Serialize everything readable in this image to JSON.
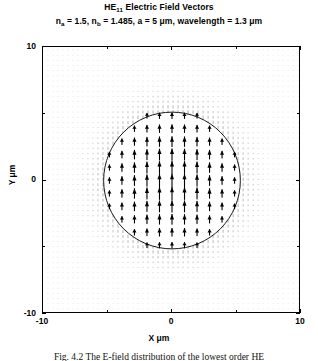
{
  "figure": {
    "title_main": "HE",
    "title_sub": "11",
    "title_rest": " Electric Field Vectors",
    "subtitle_parts": {
      "na_sym": "n",
      "na_sub": "a",
      "na_val": " = 1.5,  ",
      "nb_sym": "n",
      "nb_sub": "b",
      "nb_val": " = 1.485,   a  = 5 μm,   wavelength  =  1.3 μm"
    },
    "caption": "Fig. 4.2  The E-field distribution of the lowest order HE",
    "xtitle": "X μm",
    "ytitle": "Y μm",
    "ink_color": "#000000",
    "background_color": "#ffffff",
    "quiver_color": "#000000",
    "circle_color": "#1a1a1a"
  },
  "chart_data": {
    "type": "scatter",
    "subtype": "quiver-vector-field",
    "title": "HE11 Electric Field Vectors",
    "subtitle": "n_a = 1.5, n_b = 1.485, a = 5 μm, wavelength = 1.3 μm",
    "xlabel": "X μm",
    "ylabel": "Y μm",
    "xlim": [
      -10,
      10
    ],
    "ylim": [
      -10,
      10
    ],
    "grid": false,
    "xticks": [
      -10,
      0,
      10
    ],
    "yticks": [
      -10,
      0,
      10
    ],
    "xtick_labels": [
      "-10",
      "0",
      "10"
    ],
    "ytick_labels": [
      "-10",
      "0",
      "10"
    ],
    "xminor_ticks": [
      -5,
      5
    ],
    "yminor_ticks": [
      -5,
      5
    ],
    "legend": null,
    "annotations": [
      {
        "type": "circle",
        "label": "core-cladding boundary",
        "center_x": 0,
        "center_y": 0,
        "radius": 5.3
      }
    ],
    "parameters": {
      "n_a": 1.5,
      "n_b": 1.485,
      "core_radius_um": 5,
      "wavelength_um": 1.3,
      "mode": "HE11"
    },
    "vector_field": {
      "description": "Linearly polarized HE11 mode: all electric field vectors point in the +Y direction. Magnitude is maximum at the fiber axis and decays toward and beyond the core boundary.",
      "direction_deg": 90,
      "grid_spacing_um": 0.97,
      "core_grid_spacing_um": 0.97,
      "max_magnitude_at": [
        0,
        0
      ],
      "radial_profile": [
        {
          "r_um": 0.0,
          "magnitude": 1.0
        },
        {
          "r_um": 1.0,
          "magnitude": 0.97
        },
        {
          "r_um": 2.0,
          "magnitude": 0.9
        },
        {
          "r_um": 3.0,
          "magnitude": 0.78
        },
        {
          "r_um": 4.0,
          "magnitude": 0.62
        },
        {
          "r_um": 5.0,
          "magnitude": 0.45
        },
        {
          "r_um": 5.3,
          "magnitude": 0.4
        },
        {
          "r_um": 6.0,
          "magnitude": 0.22
        },
        {
          "r_um": 7.0,
          "magnitude": 0.1
        },
        {
          "r_um": 8.0,
          "magnitude": 0.05
        },
        {
          "r_um": 10.0,
          "magnitude": 0.02
        }
      ]
    }
  }
}
